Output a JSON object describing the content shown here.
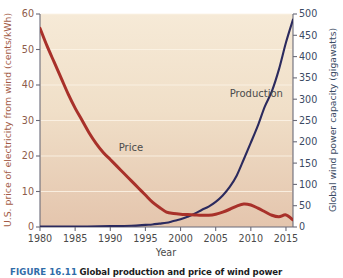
{
  "figure": {
    "caption_label": "FIGURE 16.11",
    "caption_text": "Global production and price of wind power"
  },
  "chart_data": {
    "type": "line",
    "title": "",
    "xlabel": "Year",
    "ylabel": "U.S. price of electricity from wind (cents/kWh)",
    "y2label": "Global wind power capacity (gigawatts)",
    "xlim": [
      1980,
      2016
    ],
    "ylim": [
      0,
      60
    ],
    "y2lim": [
      0,
      500
    ],
    "xticks": [
      1980,
      1985,
      1990,
      1995,
      2000,
      2005,
      2010,
      2015
    ],
    "xtick_labels": [
      "1980",
      "1985",
      "1990",
      "1995",
      "2000",
      "2005",
      "2010",
      "2015"
    ],
    "yticks": [
      0,
      10,
      20,
      30,
      40,
      50,
      60
    ],
    "ytick_labels": [
      "0",
      "10",
      "20",
      "30",
      "40",
      "50",
      "60"
    ],
    "y2ticks": [
      0,
      50,
      100,
      150,
      200,
      250,
      300,
      350,
      400,
      450,
      500
    ],
    "y2tick_labels": [
      "0",
      "50",
      "100",
      "150",
      "200",
      "250",
      "300",
      "350",
      "400",
      "450",
      "500"
    ],
    "grid": true,
    "grid_axis": "y",
    "legend": "inline-annotations",
    "plot_bgcolor": "#efe0cb",
    "series": [
      {
        "name": "Price",
        "axis": "left",
        "color": "#a8312a",
        "annotation": "Price",
        "annotation_x": 1991.2,
        "annotation_y": 21.5,
        "x": [
          1980,
          1981,
          1982,
          1983,
          1984,
          1985,
          1986,
          1987,
          1988,
          1989,
          1990,
          1991,
          1992,
          1993,
          1994,
          1995,
          1996,
          1997,
          1998,
          1999,
          2000,
          2001,
          2002,
          2003,
          2004,
          2005,
          2006,
          2007,
          2008,
          2009,
          2010,
          2011,
          2012,
          2013,
          2014,
          2015,
          2016
        ],
        "y": [
          56,
          51,
          46.5,
          42,
          37.5,
          33.5,
          30,
          26.5,
          23.5,
          21,
          19,
          17,
          15,
          13,
          11,
          9,
          7,
          5.5,
          4.2,
          3.8,
          3.6,
          3.5,
          3.4,
          3.3,
          3.3,
          3.6,
          4.2,
          5.0,
          5.9,
          6.5,
          6.2,
          5.3,
          4.3,
          3.3,
          2.9,
          3.4,
          2.0
        ]
      },
      {
        "name": "Production",
        "axis": "right",
        "color": "#2b2a5e",
        "annotation": "Production",
        "annotation_x": 2007.0,
        "annotation_y": 305,
        "x": [
          1980,
          1985,
          1990,
          1993,
          1995,
          1996,
          1997,
          1998,
          1999,
          2000,
          2001,
          2002,
          2003,
          2004,
          2005,
          2006,
          2007,
          2008,
          2009,
          2010,
          2011,
          2012,
          2013,
          2014,
          2015,
          2016
        ],
        "y": [
          1,
          1,
          2,
          3,
          5,
          6,
          8,
          10,
          14,
          18,
          24,
          31,
          40,
          48,
          59,
          74,
          94,
          121,
          159,
          198,
          238,
          283,
          319,
          370,
          433,
          487
        ]
      }
    ]
  }
}
